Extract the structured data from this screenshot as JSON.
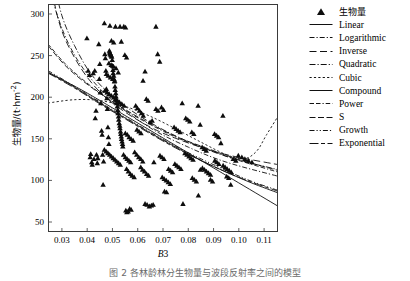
{
  "figure": {
    "caption": "图 2   各林龄林分生物量与波段反射率之间的模型"
  },
  "axes": {
    "x": {
      "label": "B3",
      "label_italic_part": "B",
      "label_plain_part": "3",
      "ticks": [
        "0.03",
        "0.04",
        "0.05",
        "0.06",
        "0.07",
        "0.08",
        "0.09",
        "0.10",
        "0.11"
      ],
      "tick_values": [
        0.03,
        0.04,
        0.05,
        0.06,
        0.07,
        0.08,
        0.09,
        0.1,
        0.11
      ],
      "range": [
        0.0245,
        0.1155
      ]
    },
    "y": {
      "label": "生物量/(t·hm",
      "label_sup": "-2",
      "label_tail": ")",
      "ticks": [
        "50",
        "100",
        "150",
        "200",
        "250",
        "300"
      ],
      "tick_values": [
        50,
        100,
        150,
        200,
        250,
        300
      ],
      "range": [
        38,
        312
      ]
    }
  },
  "legend": {
    "items": [
      {
        "label": "生物量",
        "key": "marker-triangle",
        "cjk": true
      },
      {
        "label": "Linear",
        "key": "line-solid",
        "cjk": false
      },
      {
        "label": "Logarithmic",
        "key": "line-dashdot-short",
        "cjk": false
      },
      {
        "label": "Inverse",
        "key": "line-dash-long",
        "cjk": false
      },
      {
        "label": "Quadratic",
        "key": "line-dashdot",
        "cjk": false
      },
      {
        "label": "Cubic",
        "key": "line-dotted-dash",
        "cjk": false
      },
      {
        "label": "Compound",
        "key": "line-solid",
        "cjk": false
      },
      {
        "label": "Power",
        "key": "line-dash-dash-dot",
        "cjk": false
      },
      {
        "label": "S",
        "key": "line-dash-pair",
        "cjk": false
      },
      {
        "label": "Growth",
        "key": "line-dashdotdot",
        "cjk": false
      },
      {
        "label": "Exponential",
        "key": "line-solid-dash",
        "cjk": false
      }
    ]
  },
  "chart_data": {
    "type": "scatter",
    "title": "",
    "xlabel": "B3",
    "ylabel": "生物量/(t·hm-2)",
    "xlim": [
      0.0245,
      0.1155
    ],
    "ylim": [
      38,
      312
    ],
    "grid": false,
    "legend_position": "right-outside",
    "marker": "triangle-up-filled",
    "series_name": "生物量",
    "points": [
      [
        0.0399,
        271
      ],
      [
        0.0404,
        232
      ],
      [
        0.0409,
        227
      ],
      [
        0.0412,
        128
      ],
      [
        0.0414,
        132
      ],
      [
        0.0418,
        122
      ],
      [
        0.042,
        119
      ],
      [
        0.0424,
        229
      ],
      [
        0.0427,
        126
      ],
      [
        0.043,
        232
      ],
      [
        0.0432,
        175
      ],
      [
        0.0435,
        184
      ],
      [
        0.0437,
        131
      ],
      [
        0.044,
        121
      ],
      [
        0.0442,
        127
      ],
      [
        0.0446,
        264
      ],
      [
        0.0448,
        222
      ],
      [
        0.045,
        240
      ],
      [
        0.0452,
        206
      ],
      [
        0.0454,
        193
      ],
      [
        0.0457,
        160
      ],
      [
        0.0459,
        155
      ],
      [
        0.0461,
        131
      ],
      [
        0.0463,
        95
      ],
      [
        0.0465,
        123
      ],
      [
        0.0468,
        289
      ],
      [
        0.047,
        252
      ],
      [
        0.0472,
        247
      ],
      [
        0.0474,
        232
      ],
      [
        0.0476,
        210
      ],
      [
        0.0478,
        199
      ],
      [
        0.048,
        186
      ],
      [
        0.0482,
        164
      ],
      [
        0.0484,
        152
      ],
      [
        0.0486,
        144
      ],
      [
        0.0488,
        256
      ],
      [
        0.0489,
        254
      ],
      [
        0.0491,
        253
      ],
      [
        0.0492,
        252
      ],
      [
        0.0494,
        251
      ],
      [
        0.0495,
        250
      ],
      [
        0.0497,
        249
      ],
      [
        0.0499,
        245
      ],
      [
        0.05,
        238
      ],
      [
        0.0502,
        233
      ],
      [
        0.0503,
        229
      ],
      [
        0.0505,
        226
      ],
      [
        0.0506,
        222
      ],
      [
        0.0508,
        219
      ],
      [
        0.051,
        213
      ],
      [
        0.0511,
        209
      ],
      [
        0.0513,
        205
      ],
      [
        0.0514,
        201
      ],
      [
        0.0516,
        197
      ],
      [
        0.0517,
        193
      ],
      [
        0.0519,
        189
      ],
      [
        0.0521,
        185
      ],
      [
        0.0522,
        181
      ],
      [
        0.0524,
        177
      ],
      [
        0.0525,
        173
      ],
      [
        0.0527,
        169
      ],
      [
        0.0529,
        166
      ],
      [
        0.053,
        163
      ],
      [
        0.0532,
        159
      ],
      [
        0.0533,
        156
      ],
      [
        0.0535,
        153
      ],
      [
        0.0536,
        150
      ],
      [
        0.0538,
        147
      ],
      [
        0.054,
        144
      ],
      [
        0.0541,
        141
      ],
      [
        0.049,
        286
      ],
      [
        0.0512,
        285
      ],
      [
        0.053,
        285
      ],
      [
        0.0545,
        285
      ],
      [
        0.0552,
        284
      ],
      [
        0.0486,
        241
      ],
      [
        0.0495,
        239
      ],
      [
        0.0504,
        237
      ],
      [
        0.0514,
        235
      ],
      [
        0.0523,
        230
      ],
      [
        0.0476,
        228
      ],
      [
        0.0483,
        226
      ],
      [
        0.0492,
        224
      ],
      [
        0.0501,
        222
      ],
      [
        0.0509,
        220
      ],
      [
        0.047,
        208
      ],
      [
        0.0479,
        206
      ],
      [
        0.0487,
        204
      ],
      [
        0.0496,
        202
      ],
      [
        0.0505,
        200
      ],
      [
        0.0512,
        198
      ],
      [
        0.052,
        196
      ],
      [
        0.0528,
        194
      ],
      [
        0.0537,
        192
      ],
      [
        0.0546,
        190
      ],
      [
        0.0496,
        268
      ],
      [
        0.0505,
        266
      ],
      [
        0.0535,
        267
      ],
      [
        0.0549,
        251
      ],
      [
        0.0556,
        248
      ],
      [
        0.0468,
        137
      ],
      [
        0.0475,
        135
      ],
      [
        0.0482,
        133
      ],
      [
        0.0489,
        131
      ],
      [
        0.0496,
        129
      ],
      [
        0.0503,
        127
      ],
      [
        0.051,
        125
      ],
      [
        0.0517,
        123
      ],
      [
        0.0524,
        121
      ],
      [
        0.0531,
        119
      ],
      [
        0.0544,
        131
      ],
      [
        0.0551,
        128
      ],
      [
        0.0558,
        126
      ],
      [
        0.0565,
        124
      ],
      [
        0.0572,
        122
      ],
      [
        0.0553,
        64
      ],
      [
        0.0557,
        62
      ],
      [
        0.0562,
        63
      ],
      [
        0.0568,
        66
      ],
      [
        0.0574,
        65
      ],
      [
        0.0551,
        157
      ],
      [
        0.0559,
        155
      ],
      [
        0.0566,
        152
      ],
      [
        0.0574,
        150
      ],
      [
        0.0582,
        148
      ],
      [
        0.0556,
        114
      ],
      [
        0.0563,
        111
      ],
      [
        0.0571,
        108
      ],
      [
        0.0578,
        106
      ],
      [
        0.0586,
        104
      ],
      [
        0.0592,
        190
      ],
      [
        0.0599,
        187
      ],
      [
        0.0607,
        184
      ],
      [
        0.0615,
        181
      ],
      [
        0.0622,
        178
      ],
      [
        0.0588,
        134
      ],
      [
        0.0596,
        131
      ],
      [
        0.0604,
        128
      ],
      [
        0.0612,
        126
      ],
      [
        0.062,
        123
      ],
      [
        0.0597,
        161
      ],
      [
        0.0605,
        159
      ],
      [
        0.0613,
        157
      ],
      [
        0.0621,
        220
      ],
      [
        0.0629,
        231
      ],
      [
        0.0634,
        198
      ],
      [
        0.0641,
        196
      ],
      [
        0.0649,
        170
      ],
      [
        0.0657,
        172
      ],
      [
        0.0664,
        122
      ],
      [
        0.0612,
        116
      ],
      [
        0.0619,
        113
      ],
      [
        0.0627,
        111
      ],
      [
        0.0635,
        108
      ],
      [
        0.0643,
        106
      ],
      [
        0.0629,
        72
      ],
      [
        0.0637,
        71
      ],
      [
        0.0646,
        69
      ],
      [
        0.0654,
        70
      ],
      [
        0.0661,
        71
      ],
      [
        0.0672,
        285
      ],
      [
        0.0679,
        252
      ],
      [
        0.0687,
        243
      ],
      [
        0.0694,
        188
      ],
      [
        0.0702,
        185
      ],
      [
        0.0672,
        186
      ],
      [
        0.068,
        184
      ],
      [
        0.0688,
        130
      ],
      [
        0.0696,
        128
      ],
      [
        0.0704,
        126
      ],
      [
        0.0697,
        104
      ],
      [
        0.0705,
        102
      ],
      [
        0.0713,
        100
      ],
      [
        0.0721,
        98
      ],
      [
        0.0729,
        96
      ],
      [
        0.0706,
        87
      ],
      [
        0.0714,
        86
      ],
      [
        0.0722,
        114
      ],
      [
        0.073,
        112
      ],
      [
        0.0738,
        110
      ],
      [
        0.0744,
        164
      ],
      [
        0.0752,
        162
      ],
      [
        0.076,
        160
      ],
      [
        0.0768,
        158
      ],
      [
        0.0776,
        193
      ],
      [
        0.0747,
        120
      ],
      [
        0.0755,
        118
      ],
      [
        0.0763,
        116
      ],
      [
        0.0771,
        114
      ],
      [
        0.0779,
        72
      ],
      [
        0.0787,
        133
      ],
      [
        0.0795,
        131
      ],
      [
        0.0803,
        129
      ],
      [
        0.0811,
        127
      ],
      [
        0.0819,
        125
      ],
      [
        0.079,
        175
      ],
      [
        0.0798,
        173
      ],
      [
        0.0806,
        171
      ],
      [
        0.0814,
        158
      ],
      [
        0.0822,
        156
      ],
      [
        0.0816,
        103
      ],
      [
        0.0824,
        101
      ],
      [
        0.0832,
        99
      ],
      [
        0.084,
        82
      ],
      [
        0.0848,
        113
      ],
      [
        0.0839,
        190
      ],
      [
        0.0847,
        167
      ],
      [
        0.0855,
        140
      ],
      [
        0.0863,
        138
      ],
      [
        0.0871,
        136
      ],
      [
        0.0856,
        115
      ],
      [
        0.0864,
        113
      ],
      [
        0.0872,
        111
      ],
      [
        0.088,
        109
      ],
      [
        0.0888,
        107
      ],
      [
        0.0888,
        101
      ],
      [
        0.0896,
        99
      ],
      [
        0.0904,
        156
      ],
      [
        0.0912,
        154
      ],
      [
        0.092,
        152
      ],
      [
        0.0905,
        124
      ],
      [
        0.0913,
        122
      ],
      [
        0.0921,
        120
      ],
      [
        0.0929,
        145
      ],
      [
        0.0937,
        178
      ],
      [
        0.0938,
        118
      ],
      [
        0.0946,
        116
      ],
      [
        0.0954,
        114
      ],
      [
        0.0962,
        112
      ],
      [
        0.097,
        110
      ],
      [
        0.0952,
        105
      ],
      [
        0.096,
        103
      ],
      [
        0.0968,
        95
      ],
      [
        0.0978,
        126
      ],
      [
        0.0988,
        124
      ],
      [
        0.0998,
        130
      ],
      [
        0.1012,
        128
      ],
      [
        0.1024,
        126
      ],
      [
        0.1038,
        124
      ],
      [
        0.1052,
        122
      ]
    ],
    "curves": [
      {
        "name": "Linear",
        "style": "solid",
        "path": [
          [
            0.0245,
            230
          ],
          [
            0.04,
            205
          ],
          [
            0.055,
            178
          ],
          [
            0.07,
            151
          ],
          [
            0.085,
            124
          ],
          [
            0.1,
            97
          ],
          [
            0.1155,
            69
          ]
        ]
      },
      {
        "name": "Logarithmic",
        "style": "dashdot-short",
        "path": [
          [
            0.0245,
            340
          ],
          [
            0.028,
            300
          ],
          [
            0.033,
            262
          ],
          [
            0.04,
            228
          ],
          [
            0.05,
            196
          ],
          [
            0.065,
            163
          ],
          [
            0.08,
            140
          ],
          [
            0.095,
            122
          ],
          [
            0.1155,
            105
          ]
        ]
      },
      {
        "name": "Inverse",
        "style": "dash-long",
        "path": [
          [
            0.0256,
            340
          ],
          [
            0.028,
            300
          ],
          [
            0.032,
            265
          ],
          [
            0.04,
            224
          ],
          [
            0.05,
            193
          ],
          [
            0.065,
            164
          ],
          [
            0.08,
            145
          ],
          [
            0.095,
            131
          ],
          [
            0.1155,
            119
          ]
        ]
      },
      {
        "name": "Quadratic",
        "style": "dashdot",
        "path": [
          [
            0.0268,
            340
          ],
          [
            0.03,
            298
          ],
          [
            0.035,
            262
          ],
          [
            0.042,
            226
          ],
          [
            0.052,
            196
          ],
          [
            0.067,
            166
          ],
          [
            0.082,
            144
          ],
          [
            0.097,
            127
          ],
          [
            0.1155,
            113
          ]
        ]
      },
      {
        "name": "Cubic",
        "style": "dotted-dash",
        "path": [
          [
            0.0245,
            193
          ],
          [
            0.035,
            197
          ],
          [
            0.045,
            196
          ],
          [
            0.055,
            189
          ],
          [
            0.065,
            177
          ],
          [
            0.075,
            162
          ],
          [
            0.085,
            146
          ],
          [
            0.095,
            131
          ],
          [
            0.102,
            126
          ],
          [
            0.107,
            135
          ],
          [
            0.111,
            155
          ],
          [
            0.1155,
            177
          ]
        ]
      },
      {
        "name": "Compound",
        "style": "solid",
        "path": [
          [
            0.0245,
            230
          ],
          [
            0.035,
            212
          ],
          [
            0.045,
            193
          ],
          [
            0.055,
            175
          ],
          [
            0.065,
            157
          ],
          [
            0.075,
            140
          ],
          [
            0.085,
            124
          ],
          [
            0.095,
            110
          ],
          [
            0.105,
            97
          ],
          [
            0.1155,
            85
          ]
        ]
      },
      {
        "name": "Power",
        "style": "dash-dash-dot",
        "path": [
          [
            0.0245,
            264
          ],
          [
            0.032,
            238
          ],
          [
            0.042,
            212
          ],
          [
            0.052,
            190
          ],
          [
            0.062,
            172
          ],
          [
            0.075,
            152
          ],
          [
            0.088,
            137
          ],
          [
            0.1,
            124
          ],
          [
            0.1155,
            110
          ]
        ]
      },
      {
        "name": "S",
        "style": "dash-pair",
        "path": [
          [
            0.0245,
            262
          ],
          [
            0.032,
            236
          ],
          [
            0.042,
            211
          ],
          [
            0.052,
            191
          ],
          [
            0.062,
            173
          ],
          [
            0.075,
            153
          ],
          [
            0.088,
            138
          ],
          [
            0.1,
            125
          ],
          [
            0.1155,
            112
          ]
        ]
      },
      {
        "name": "Growth",
        "style": "dashdotdot",
        "path": [
          [
            0.0245,
            232
          ],
          [
            0.035,
            213
          ],
          [
            0.045,
            194
          ],
          [
            0.055,
            176
          ],
          [
            0.065,
            158
          ],
          [
            0.075,
            141
          ],
          [
            0.085,
            126
          ],
          [
            0.095,
            112
          ],
          [
            0.105,
            99
          ],
          [
            0.1155,
            88
          ]
        ]
      },
      {
        "name": "Exponential",
        "style": "solid-dash",
        "path": [
          [
            0.0245,
            229
          ],
          [
            0.035,
            211
          ],
          [
            0.045,
            192
          ],
          [
            0.055,
            174
          ],
          [
            0.065,
            156
          ],
          [
            0.075,
            139
          ],
          [
            0.085,
            124
          ],
          [
            0.095,
            110
          ],
          [
            0.105,
            98
          ],
          [
            0.1155,
            87
          ]
        ]
      }
    ]
  }
}
